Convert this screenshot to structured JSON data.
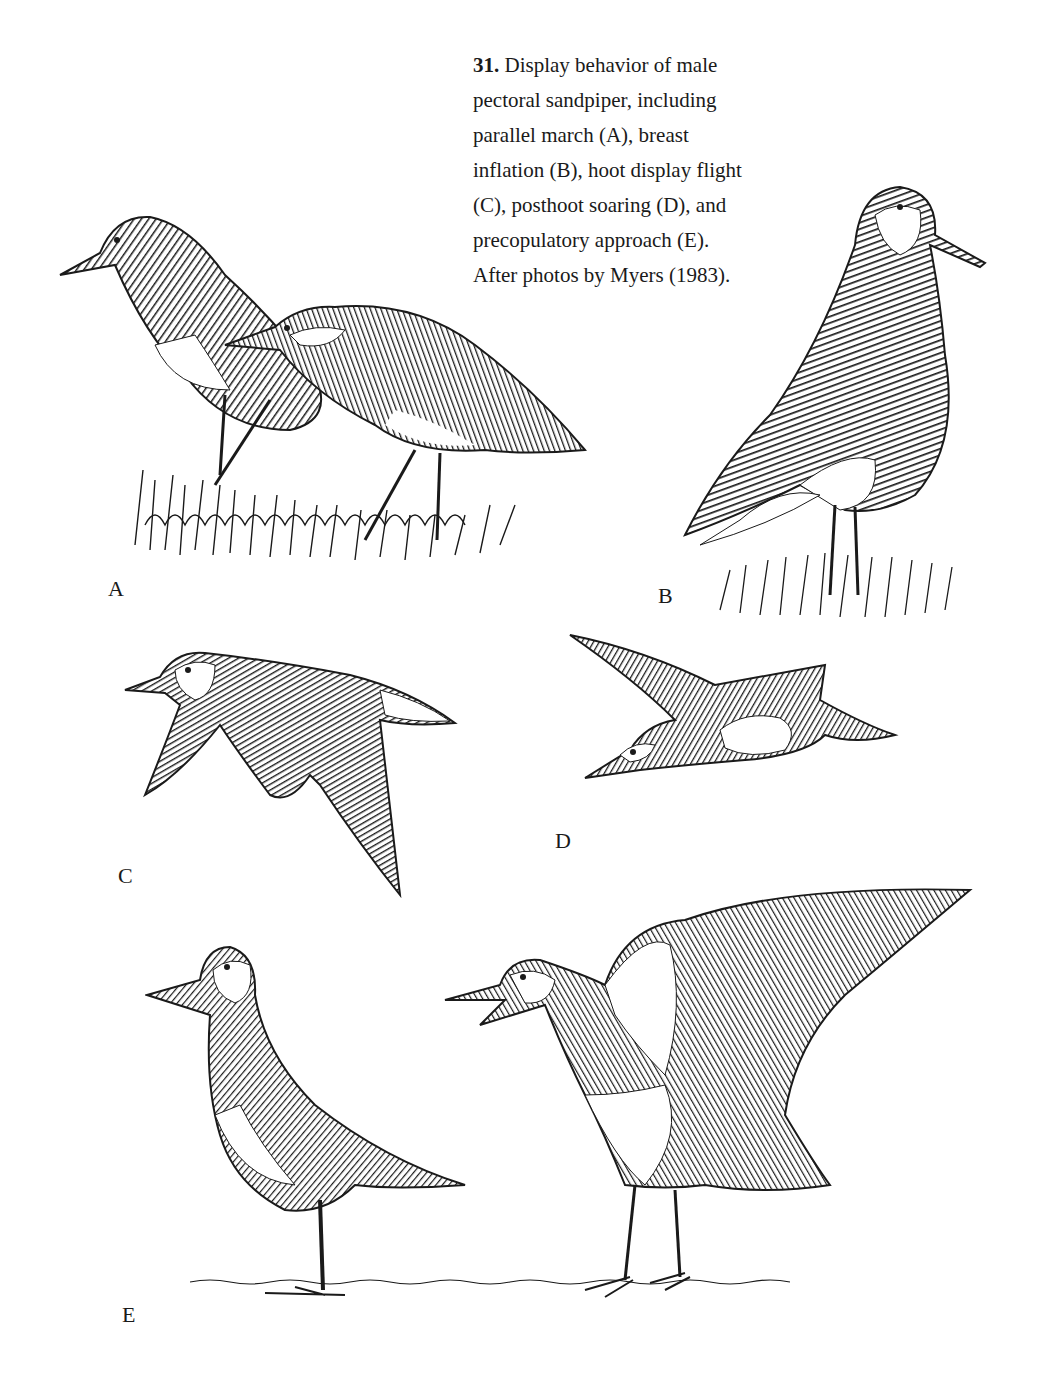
{
  "caption": {
    "figure_number": "31.",
    "lines": [
      "Display behavior of male",
      "pectoral sandpiper, including",
      "parallel march (A), breast",
      "inflation (B), hoot display flight",
      "(C), posthoot soaring (D), and",
      "precopulatory approach (E).",
      "After photos by Myers (1983)."
    ]
  },
  "panels": [
    {
      "id": "A",
      "label": "A",
      "description": "parallel march"
    },
    {
      "id": "B",
      "label": "B",
      "description": "breast inflation"
    },
    {
      "id": "C",
      "label": "C",
      "description": "hoot display flight"
    },
    {
      "id": "D",
      "label": "D",
      "description": "posthoot soaring"
    },
    {
      "id": "E",
      "label": "E",
      "description": "precopulatory approach"
    }
  ],
  "colors": {
    "ink": "#1a1a1a",
    "paper": "#ffffff",
    "mid": "#555555"
  }
}
